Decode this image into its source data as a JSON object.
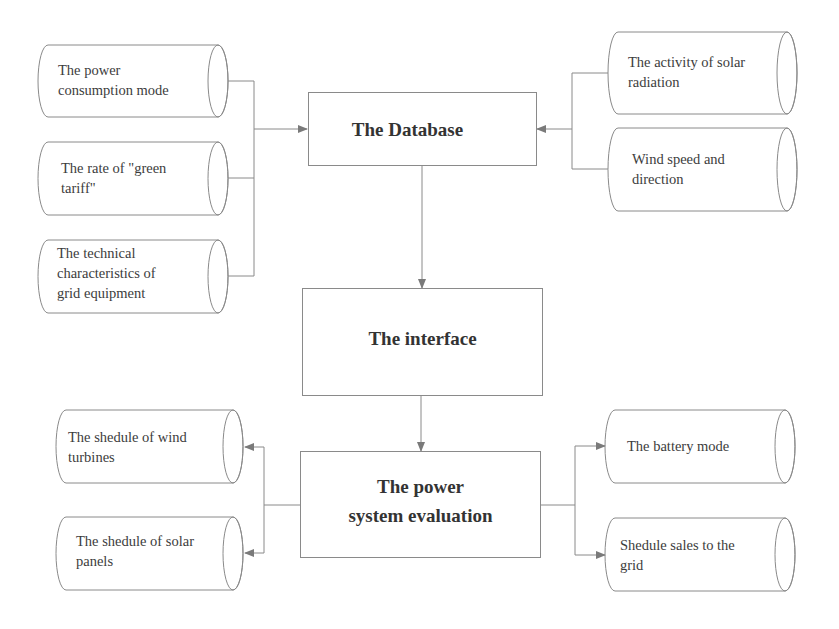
{
  "diagram": {
    "type": "flowchart",
    "colors": {
      "line": "#8a8a8a",
      "arrow": "#7a7a7a",
      "text": "#333333"
    },
    "process_boxes": {
      "database": {
        "label": "The Database"
      },
      "interface": {
        "label": "The interface"
      },
      "evaluation": {
        "label_line1": "The power",
        "label_line2": "system evaluation"
      }
    },
    "inputs_left": [
      {
        "line1": "The power",
        "line2": "consumption mode",
        "line3": ""
      },
      {
        "line1": "The rate of \"green",
        "line2": "tariff\"",
        "line3": ""
      },
      {
        "line1": "The technical",
        "line2": "characteristics of",
        "line3": "grid equipment"
      }
    ],
    "inputs_right": [
      {
        "line1": "The activity of solar",
        "line2": "radiation"
      },
      {
        "line1": "Wind speed and",
        "line2": "direction"
      }
    ],
    "outputs_left": [
      {
        "line1": "The shedule of wind",
        "line2": "turbines"
      },
      {
        "line1": "The shedule of solar",
        "line2": "panels"
      }
    ],
    "outputs_right": [
      {
        "line1": "The battery mode",
        "line2": ""
      },
      {
        "line1": "Shedule sales to the",
        "line2": "grid"
      }
    ],
    "edges": [
      {
        "from": "inputs_left",
        "to": "The Database"
      },
      {
        "from": "inputs_right",
        "to": "The Database"
      },
      {
        "from": "The Database",
        "to": "The interface"
      },
      {
        "from": "The interface",
        "to": "The power system evaluation"
      },
      {
        "from": "The power system evaluation",
        "to": "outputs_left"
      },
      {
        "from": "The power system evaluation",
        "to": "outputs_right"
      }
    ]
  }
}
